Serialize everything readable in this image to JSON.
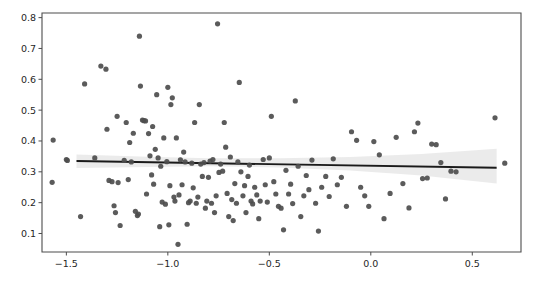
{
  "figure": {
    "background_color": "#ffffff",
    "width": 540,
    "height": 287
  },
  "axes": {
    "plot_area": {
      "left": 42,
      "top": 13,
      "right": 521,
      "bottom": 252
    },
    "spine_color": "#4d4d4d",
    "point_color": "#4d4d4d",
    "line_color": "#1a1a1a",
    "band_color": "#bdbdbd"
  },
  "chart_data": {
    "type": "scatter",
    "title": "",
    "xlabel": "",
    "ylabel": "",
    "xlim": [
      -1.62,
      0.74
    ],
    "ylim": [
      0.04,
      0.815
    ],
    "grid": false,
    "legend": null,
    "xticks": [
      -1.5,
      -1.0,
      -0.5,
      0.0,
      0.5
    ],
    "xtick_labels": [
      "−1.5",
      "−1.0",
      "−0.5",
      "0.0",
      "0.5"
    ],
    "yticks": [
      0.1,
      0.2,
      0.3,
      0.4,
      0.5,
      0.6,
      0.7,
      0.8
    ],
    "ytick_labels": [
      "0.1",
      "0.2",
      "0.3",
      "0.4",
      "0.5",
      "0.6",
      "0.7",
      "0.8"
    ],
    "marker_size": 5.2,
    "series": [
      {
        "name": "observations",
        "type": "scatter",
        "points": [
          [
            -1.565,
            0.403
          ],
          [
            -1.57,
            0.266
          ],
          [
            -1.5,
            0.34
          ],
          [
            -1.495,
            0.337
          ],
          [
            -1.43,
            0.155
          ],
          [
            -1.41,
            0.585
          ],
          [
            -1.36,
            0.345
          ],
          [
            -1.33,
            0.643
          ],
          [
            -1.305,
            0.633
          ],
          [
            -1.3,
            0.438
          ],
          [
            -1.29,
            0.272
          ],
          [
            -1.275,
            0.268
          ],
          [
            -1.265,
            0.19
          ],
          [
            -1.258,
            0.168
          ],
          [
            -1.25,
            0.48
          ],
          [
            -1.245,
            0.265
          ],
          [
            -1.235,
            0.126
          ],
          [
            -1.215,
            0.337
          ],
          [
            -1.205,
            0.46
          ],
          [
            -1.195,
            0.275
          ],
          [
            -1.188,
            0.395
          ],
          [
            -1.18,
            0.332
          ],
          [
            -1.17,
            0.425
          ],
          [
            -1.16,
            0.172
          ],
          [
            -1.15,
            0.158
          ],
          [
            -1.145,
            0.163
          ],
          [
            -1.14,
            0.74
          ],
          [
            -1.135,
            0.578
          ],
          [
            -1.125,
            0.468
          ],
          [
            -1.118,
            0.466
          ],
          [
            -1.11,
            0.465
          ],
          [
            -1.105,
            0.228
          ],
          [
            -1.095,
            0.424
          ],
          [
            -1.088,
            0.352
          ],
          [
            -1.08,
            0.29
          ],
          [
            -1.075,
            0.447
          ],
          [
            -1.07,
            0.26
          ],
          [
            -1.062,
            0.373
          ],
          [
            -1.055,
            0.55
          ],
          [
            -1.048,
            0.345
          ],
          [
            -1.04,
            0.122
          ],
          [
            -1.035,
            0.318
          ],
          [
            -1.028,
            0.202
          ],
          [
            -1.02,
            0.41
          ],
          [
            -1.012,
            0.195
          ],
          [
            -1.005,
            0.333
          ],
          [
            -1.0,
            0.574
          ],
          [
            -0.995,
            0.128
          ],
          [
            -0.99,
            0.255
          ],
          [
            -0.985,
            0.518
          ],
          [
            -0.978,
            0.54
          ],
          [
            -0.97,
            0.218
          ],
          [
            -0.965,
            0.205
          ],
          [
            -0.958,
            0.41
          ],
          [
            -0.95,
            0.065
          ],
          [
            -0.945,
            0.225
          ],
          [
            -0.938,
            0.339
          ],
          [
            -0.93,
            0.258
          ],
          [
            -0.922,
            0.364
          ],
          [
            -0.915,
            0.332
          ],
          [
            -0.905,
            0.13
          ],
          [
            -0.898,
            0.2
          ],
          [
            -0.89,
            0.205
          ],
          [
            -0.882,
            0.328
          ],
          [
            -0.875,
            0.248
          ],
          [
            -0.868,
            0.46
          ],
          [
            -0.86,
            0.198
          ],
          [
            -0.852,
            0.218
          ],
          [
            -0.845,
            0.518
          ],
          [
            -0.838,
            0.325
          ],
          [
            -0.83,
            0.285
          ],
          [
            -0.822,
            0.33
          ],
          [
            -0.815,
            0.182
          ],
          [
            -0.808,
            0.205
          ],
          [
            -0.8,
            0.282
          ],
          [
            -0.792,
            0.335
          ],
          [
            -0.785,
            0.198
          ],
          [
            -0.778,
            0.34
          ],
          [
            -0.77,
            0.168
          ],
          [
            -0.762,
            0.222
          ],
          [
            -0.755,
            0.78
          ],
          [
            -0.748,
            0.298
          ],
          [
            -0.74,
            0.325
          ],
          [
            -0.73,
            0.302
          ],
          [
            -0.722,
            0.46
          ],
          [
            -0.715,
            0.38
          ],
          [
            -0.708,
            0.23
          ],
          [
            -0.7,
            0.155
          ],
          [
            -0.692,
            0.348
          ],
          [
            -0.685,
            0.21
          ],
          [
            -0.678,
            0.142
          ],
          [
            -0.67,
            0.262
          ],
          [
            -0.662,
            0.198
          ],
          [
            -0.655,
            0.332
          ],
          [
            -0.648,
            0.59
          ],
          [
            -0.64,
            0.3
          ],
          [
            -0.63,
            0.222
          ],
          [
            -0.622,
            0.255
          ],
          [
            -0.615,
            0.168
          ],
          [
            -0.605,
            0.285
          ],
          [
            -0.598,
            0.322
          ],
          [
            -0.59,
            0.205
          ],
          [
            -0.582,
            0.196
          ],
          [
            -0.572,
            0.25
          ],
          [
            -0.562,
            0.225
          ],
          [
            -0.552,
            0.148
          ],
          [
            -0.545,
            0.205
          ],
          [
            -0.53,
            0.34
          ],
          [
            -0.52,
            0.258
          ],
          [
            -0.51,
            0.202
          ],
          [
            -0.5,
            0.345
          ],
          [
            -0.49,
            0.48
          ],
          [
            -0.478,
            0.268
          ],
          [
            -0.468,
            0.228
          ],
          [
            -0.455,
            0.188
          ],
          [
            -0.442,
            0.182
          ],
          [
            -0.43,
            0.112
          ],
          [
            -0.418,
            0.305
          ],
          [
            -0.405,
            0.228
          ],
          [
            -0.395,
            0.26
          ],
          [
            -0.385,
            0.197
          ],
          [
            -0.372,
            0.53
          ],
          [
            -0.358,
            0.318
          ],
          [
            -0.345,
            0.155
          ],
          [
            -0.33,
            0.222
          ],
          [
            -0.318,
            0.288
          ],
          [
            -0.305,
            0.242
          ],
          [
            -0.29,
            0.338
          ],
          [
            -0.272,
            0.198
          ],
          [
            -0.258,
            0.108
          ],
          [
            -0.242,
            0.25
          ],
          [
            -0.222,
            0.285
          ],
          [
            -0.205,
            0.22
          ],
          [
            -0.185,
            0.342
          ],
          [
            -0.165,
            0.258
          ],
          [
            -0.145,
            0.282
          ],
          [
            -0.12,
            0.188
          ],
          [
            -0.095,
            0.43
          ],
          [
            -0.07,
            0.402
          ],
          [
            -0.05,
            0.25
          ],
          [
            -0.03,
            0.222
          ],
          [
            -0.01,
            0.188
          ],
          [
            0.015,
            0.398
          ],
          [
            0.042,
            0.355
          ],
          [
            0.065,
            0.148
          ],
          [
            0.095,
            0.23
          ],
          [
            0.125,
            0.412
          ],
          [
            0.158,
            0.262
          ],
          [
            0.188,
            0.183
          ],
          [
            0.215,
            0.43
          ],
          [
            0.232,
            0.458
          ],
          [
            0.255,
            0.278
          ],
          [
            0.278,
            0.28
          ],
          [
            0.3,
            0.39
          ],
          [
            0.322,
            0.388
          ],
          [
            0.345,
            0.33
          ],
          [
            0.368,
            0.212
          ],
          [
            0.395,
            0.302
          ],
          [
            0.42,
            0.3
          ],
          [
            0.612,
            0.475
          ],
          [
            0.66,
            0.328
          ]
        ]
      },
      {
        "name": "regression-line",
        "type": "line",
        "x_start": -1.45,
        "x_end": 0.62,
        "y_start": 0.335,
        "y_end": 0.313
      }
    ],
    "confidence_band": {
      "name": "confidence-interval",
      "x": [
        -1.45,
        -1.1,
        -0.8,
        -0.45,
        -0.1,
        0.25,
        0.62
      ],
      "upper": [
        0.356,
        0.349,
        0.344,
        0.344,
        0.348,
        0.358,
        0.375
      ],
      "lower": [
        0.312,
        0.316,
        0.318,
        0.314,
        0.304,
        0.288,
        0.262
      ]
    }
  }
}
